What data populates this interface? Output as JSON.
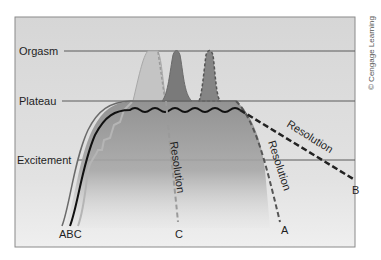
{
  "diagram": {
    "title": "",
    "phases": [
      {
        "label": "Orgasm",
        "y": 51
      },
      {
        "label": "Plateau",
        "y": 101
      },
      {
        "label": "Excitement",
        "y": 160
      }
    ],
    "curves": [
      {
        "id": "A",
        "label": "A",
        "description": "Rises through excitement, plateau, then multiple orgasm peaks, then resolution",
        "resolution_label": "Resolution"
      },
      {
        "id": "B",
        "label": "B",
        "description": "Rises to plateau with wavy line, no orgasm, slow resolution",
        "resolution_label": "Resolution"
      },
      {
        "id": "C",
        "label": "C",
        "description": "Stepwise rise, single orgasm, rapid resolution",
        "resolution_label": "Resolution"
      }
    ],
    "start_labels": "ABC",
    "end_labels": {
      "C": "C",
      "A": "A",
      "B": "B"
    },
    "credit": "© Cengage Learning",
    "colors": {
      "background": "#d9d9d9",
      "frame": "#8a8a8a",
      "gridline": "#5a5a5a",
      "curve_A_fill": "#8c8c8c",
      "curve_C_fill": "#bdbdbd",
      "curve_B_line": "#1a1a1a"
    }
  }
}
